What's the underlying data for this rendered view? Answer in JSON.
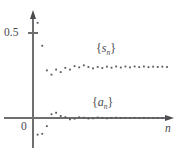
{
  "figure": {
    "name": "sequence-convergence-scatter",
    "width": 179,
    "height": 157,
    "background": "#ffffff",
    "dot_color": "#58585d",
    "axis_color": "#6f6f72"
  },
  "labels": {
    "y_tick_half": "0.5",
    "y_tick_zero": "0",
    "x_axis": "n",
    "series_sn_open": "{",
    "series_sn_base": "s",
    "series_sn_sub": "n",
    "series_sn_close": "}",
    "series_an_open": "{",
    "series_an_base": "a",
    "series_an_sub": "n",
    "series_an_close": "}"
  },
  "chart_data": {
    "type": "scatter",
    "title": "",
    "xlabel": "n",
    "ylabel": "",
    "grid": false,
    "legend": "inline-annotations",
    "annotations": [
      {
        "text": "{s_n}",
        "x": 12,
        "y": 0.38
      },
      {
        "text": "{a_n}",
        "x": 11,
        "y": 0.115
      }
    ],
    "axes": {
      "x_origin_px": 33,
      "y_origin_px": 118,
      "xlim": [
        0,
        30
      ],
      "ylim": [
        -0.12,
        0.62
      ],
      "y_ticks": [
        0,
        0.5
      ],
      "y_tick_labels": [
        "0",
        "0.5"
      ],
      "x_ticks": [],
      "x_tick_labels": []
    },
    "series": [
      {
        "name": "{s_n}",
        "marker": "square-dot",
        "x": [
          1,
          2,
          3,
          4,
          5,
          6,
          7,
          8,
          9,
          10,
          11,
          12,
          13,
          14,
          15,
          16,
          17,
          18,
          19,
          20,
          21,
          22,
          23,
          24,
          25,
          26,
          27,
          28,
          29
        ],
        "y": [
          0.56,
          0.425,
          0.28,
          0.255,
          0.285,
          0.27,
          0.295,
          0.285,
          0.305,
          0.298,
          0.31,
          0.3,
          0.292,
          0.3,
          0.294,
          0.302,
          0.296,
          0.303,
          0.297,
          0.303,
          0.298,
          0.303,
          0.299,
          0.303,
          0.299,
          0.302,
          0.3,
          0.302,
          0.3
        ]
      },
      {
        "name": "{a_n}",
        "marker": "square-dot",
        "x": [
          1,
          2,
          3,
          4,
          5,
          6,
          7,
          8,
          9,
          10,
          11,
          12,
          13,
          14,
          15,
          16,
          17,
          18,
          19,
          20,
          21,
          22,
          23,
          24,
          25,
          26,
          27,
          28,
          29
        ],
        "y": [
          -0.098,
          -0.093,
          -0.048,
          0.022,
          0.031,
          0.012,
          0.005,
          -0.008,
          -0.004,
          0.004,
          0.002,
          -0.003,
          -0.002,
          0.003,
          0.001,
          -0.002,
          0.001,
          0.002,
          0.0,
          0.001,
          0.0,
          0.001,
          0.0,
          0.001,
          0.0,
          0.0,
          0.0,
          0.0,
          0.0
        ]
      }
    ]
  }
}
